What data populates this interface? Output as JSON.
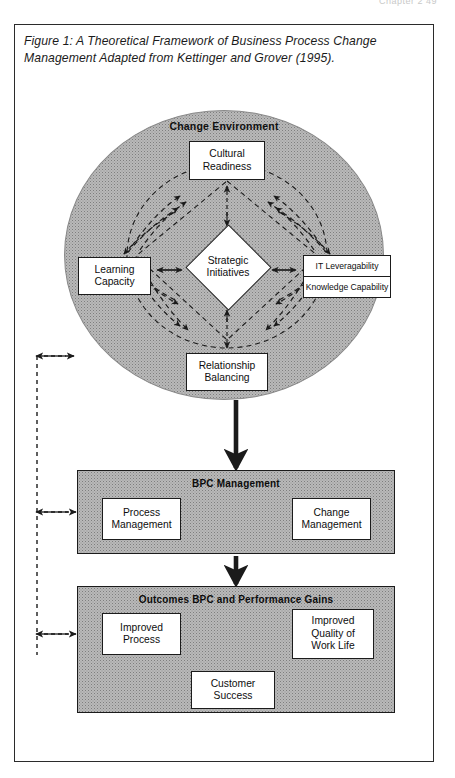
{
  "page_header": "Chapter 2    49",
  "figure": {
    "caption": "Figure 1: A Theoretical Framework of Business Process Change Management Adapted from Kettinger and Grover (1995)."
  },
  "diagram": {
    "title": "A Theoretical Framework of Business Process Change Management",
    "change_environment": {
      "label": "Change Environment",
      "center_node": {
        "line1": "Strategic",
        "line2": "Initiatives"
      },
      "nodes": [
        {
          "line1": "Cultural",
          "line2": "Readiness"
        },
        {
          "line1": "Learning",
          "line2": "Capacity"
        },
        {
          "line1": "Relationship",
          "line2": "Balancing"
        }
      ],
      "right_node": {
        "top": "IT Leveragability",
        "bottom": "Knowledge Capability"
      }
    },
    "bpc_management": {
      "label": "BPC Management",
      "nodes": [
        {
          "line1": "Process",
          "line2": "Management"
        },
        {
          "line1": "Change",
          "line2": "Management"
        }
      ]
    },
    "outcomes": {
      "label": "Outcomes BPC and Performance Gains",
      "nodes": [
        {
          "line1": "Improved",
          "line2": "Process"
        },
        {
          "line1": "Improved",
          "line2": "Quality of",
          "line3": "Work Life"
        },
        {
          "line1": "Customer",
          "line2": "Success"
        }
      ]
    }
  },
  "colors": {
    "ink": "#1b1b1b",
    "shade": "#b9b9b9",
    "frame": "#2b2b2b",
    "paper": "#ffffff"
  }
}
